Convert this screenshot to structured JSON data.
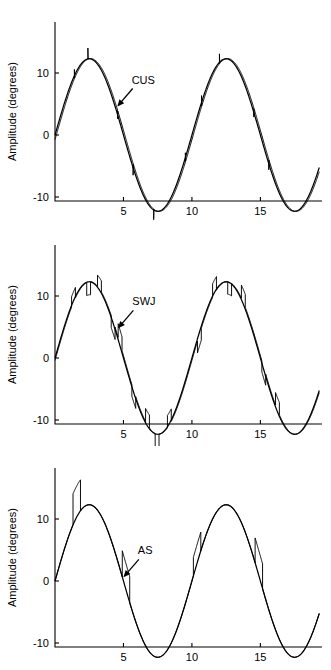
{
  "figure": {
    "background": "#ffffff",
    "line_color": "#000000",
    "panel_count": 3
  },
  "axes": {
    "xlabel": "Time (seconds)",
    "ylabel": "Amplitude (degrees)",
    "xticks": [
      5,
      10,
      15
    ],
    "xtick_labels": [
      "5",
      "10",
      "15"
    ],
    "yticks": [
      10,
      0,
      -10
    ],
    "ytick_labels": [
      "10",
      "0",
      "-10"
    ],
    "xlim": [
      0,
      19.5
    ],
    "ylim": [
      -16,
      16
    ],
    "grid": false,
    "spines": [
      "left",
      "bottom"
    ]
  },
  "panels": [
    {
      "id": "panel-cus",
      "annotation": "CUS",
      "annotation_full": "catch-up saccades",
      "annotation_x": 4.55,
      "annotation_y": 4.6,
      "label_x": 5.6,
      "label_y": 8.3
    },
    {
      "id": "panel-swj",
      "annotation": "SWJ",
      "annotation_full": "square-wave jerks",
      "annotation_x": 4.6,
      "annotation_y": 4.8,
      "label_x": 5.65,
      "label_y": 8.5
    },
    {
      "id": "panel-as",
      "annotation": "AS",
      "annotation_full": "saccadic intrusions",
      "annotation_x": 5.0,
      "annotation_y": 0.6,
      "label_x": 6.05,
      "label_y": 4.3
    }
  ],
  "chart_data": {
    "type": "line",
    "title": "",
    "xlabel": "Time (seconds)",
    "ylabel": "Amplitude (degrees)",
    "xlim": [
      0,
      19.5
    ],
    "ylim": [
      -16,
      16
    ],
    "xticks": [
      5,
      10,
      15
    ],
    "yticks": [
      10,
      0,
      -10
    ],
    "grid": false,
    "legend": "none",
    "target": {
      "name": "target sinusoid",
      "waveform": "sine",
      "amplitude": 12.3,
      "period_seconds": 10.0,
      "phase_seconds": 0.0,
      "offset": 0.0,
      "t_start": 0.0,
      "t_end": 19.3
    },
    "series": [
      {
        "name": "CUS",
        "panel": "panel-cus",
        "description": "eye trace with frequent small catch-up saccade steps riding on the sine",
        "intrusion_type": "catch-up saccade",
        "intrusion_count": 10,
        "intrusion_mean_amplitude_deg": 1.6,
        "intrusions_t": [
          1.4,
          2.4,
          4.55,
          5.7,
          7.2,
          9.5,
          10.7,
          12.0,
          14.5,
          15.6
        ],
        "intrusions_amp": [
          1.5,
          1.8,
          1.4,
          1.9,
          1.7,
          1.5,
          1.8,
          1.6,
          1.5,
          1.7
        ]
      },
      {
        "name": "SWJ",
        "panel": "panel-swj",
        "description": "eye trace with paired square-wave jerk excursions away from and back to the sine",
        "intrusion_type": "square-wave jerk",
        "intrusion_count": 13,
        "intrusion_mean_amplitude_deg": 2.0,
        "intrusions_t": [
          1.2,
          2.3,
          3.1,
          4.1,
          4.6,
          5.6,
          6.6,
          7.3,
          8.2,
          10.4,
          11.5,
          12.6,
          13.6,
          15.1,
          16.1
        ],
        "intrusions_amp": [
          1.7,
          2.1,
          1.8,
          2.0,
          2.2,
          1.9,
          2.1,
          2.4,
          2.0,
          1.9,
          2.2,
          2.0,
          2.1,
          1.8,
          2.0
        ]
      },
      {
        "name": "AS",
        "panel": "panel-as",
        "description": "eye trace with sparse large rectangular saccadic intrusions",
        "intrusion_type": "saccadic intrusion",
        "intrusion_count": 4,
        "intrusion_mean_amplitude_deg": 4.5,
        "intrusions_t": [
          1.3,
          4.9,
          10.1,
          14.6
        ],
        "intrusions_amp": [
          5.0,
          4.2,
          3.0,
          4.0
        ]
      }
    ]
  }
}
